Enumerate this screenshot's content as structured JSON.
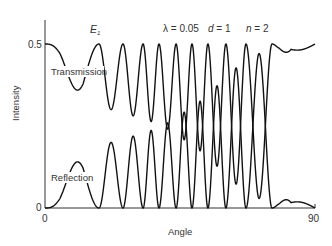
{
  "chart_data": {
    "type": "line",
    "title": "",
    "xlabel": "Angle",
    "ylabel": "Intensity",
    "xlim": [
      0,
      90
    ],
    "ylim": [
      0,
      0.5
    ],
    "x_ticks": [
      "0",
      "90"
    ],
    "y_ticks": [
      "0",
      "0.5"
    ],
    "grid": false,
    "legend": "none",
    "annotations": {
      "field_label": "E",
      "field_subscript": "1",
      "lambda": "λ = 0.05",
      "d": "d = 1",
      "n": "n = 2"
    },
    "series": [
      {
        "name": "Transmission",
        "description": "T = 0.5 − R; oscillates between 0.5 and a dropping minimum",
        "peak_angles_T_max": [
          0,
          18,
          26,
          32.7,
          38,
          43.7,
          49,
          54.3,
          60.3,
          67,
          75.7,
          90
        ],
        "endpoints": {
          "at_0": 0.5,
          "at_90": 0.49
        }
      },
      {
        "name": "Reflection",
        "description": "R oscillates between 0 and an envelope that grows with angle",
        "envelope_nodes": [
          [
            0,
            0.0
          ],
          [
            5,
            0.05
          ],
          [
            12.7,
            0.19
          ],
          [
            22,
            0.2
          ],
          [
            29.7,
            0.22
          ],
          [
            35,
            0.235
          ],
          [
            41,
            0.26
          ],
          [
            46,
            0.29
          ],
          [
            51,
            0.32
          ],
          [
            57,
            0.37
          ],
          [
            64,
            0.43
          ],
          [
            71,
            0.47
          ],
          [
            75,
            0.48
          ],
          [
            78,
            0.2
          ],
          [
            82,
            0.04
          ],
          [
            90,
            0.0
          ]
        ],
        "endpoints": {
          "at_0": 0.0,
          "at_90": 0.0
        }
      }
    ]
  },
  "labels": {
    "transmission": "Transmission",
    "reflection": "Reflection",
    "x_axis": "Angle",
    "y_axis": "Intensity",
    "x_min": "0",
    "x_max": "90",
    "y_min": "0",
    "y_max": "0.5",
    "e_main": "E",
    "e_sub": "1",
    "lambda": "λ = 0.05",
    "d_var": "d",
    "d_val": " = 1",
    "n_var": "n",
    "n_val": " = 2"
  }
}
